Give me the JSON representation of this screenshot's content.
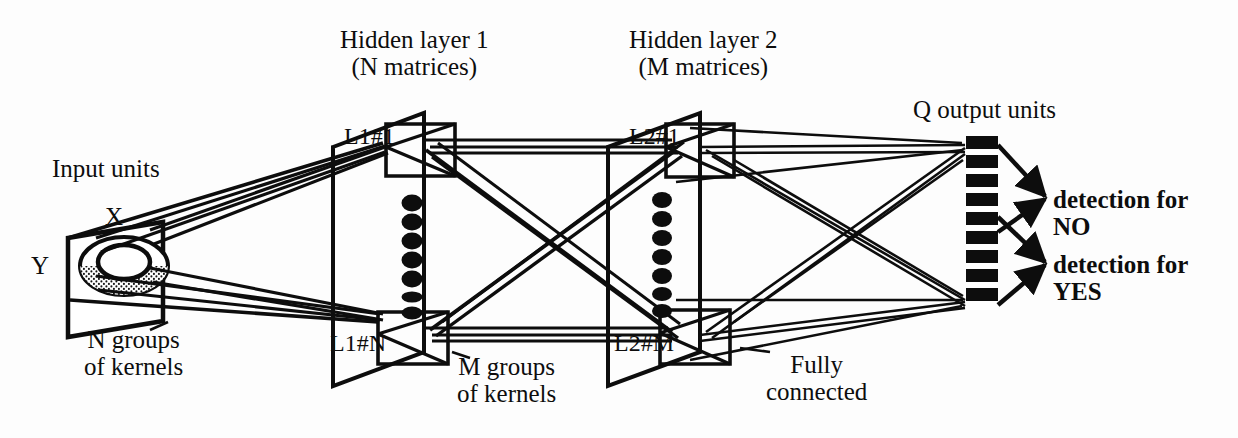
{
  "figure": {
    "domain": "diagram",
    "background_color": "#ffffff",
    "ink_color": "#0d0d0d",
    "width": 1238,
    "height": 438
  },
  "labels": {
    "hidden_layer_1": "Hidden layer 1\n(N matrices)",
    "hidden_layer_2": "Hidden layer 2\n(M matrices)",
    "q_output_units": "Q output units",
    "input_units": "Input units",
    "axis_x": "X",
    "axis_y": "Y",
    "n_groups_of_kernels": "N groups\nof kernels",
    "m_groups_of_kernels": "M groups\nof kernels",
    "fully_connected": "Fully\nconnected",
    "matrix_l1_first": "L1#1",
    "matrix_l1_last": "L1#N",
    "matrix_l2_first": "L2#1",
    "matrix_l2_last": "L2#M",
    "detection_no": "detection for\nNO",
    "detection_yes": "detection for\nYES"
  },
  "structure": {
    "layers": [
      {
        "name": "input",
        "label": "Input units",
        "plane_count": 1,
        "receptive_field": "shaded ellipse"
      },
      {
        "name": "hidden1",
        "label": "Hidden layer 1",
        "matrix_count_symbol": "N",
        "first": "L1#1",
        "last": "L1#N"
      },
      {
        "name": "hidden2",
        "label": "Hidden layer 2",
        "matrix_count_symbol": "M",
        "first": "L2#1",
        "last": "L2#M"
      },
      {
        "name": "output",
        "label": "Q output units",
        "unit_count_symbol": "Q",
        "bands": 9
      }
    ],
    "connections": [
      {
        "from": "input",
        "to": "hidden1",
        "type": "N groups of kernels"
      },
      {
        "from": "hidden1",
        "to": "hidden2",
        "type": "M groups of kernels"
      },
      {
        "from": "hidden2",
        "to": "output",
        "type": "Fully connected"
      }
    ],
    "outputs": [
      {
        "label": "detection for NO"
      },
      {
        "label": "detection for YES"
      }
    ]
  }
}
